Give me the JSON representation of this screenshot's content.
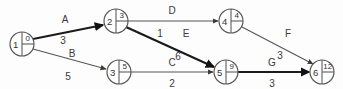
{
  "diagram": {
    "type": "activity-network-pert-cpm",
    "canvas": {
      "width": 343,
      "height": 89,
      "background": "#fdfdfd"
    },
    "colors": {
      "node_stroke": "#555555",
      "node_fill": "#ffffff",
      "edge_thin": "#555555",
      "edge_bold": "#1a1a1a",
      "text": "#333333"
    },
    "nodes": [
      {
        "id": "n1",
        "number": "1",
        "value": "0",
        "cx": 22,
        "cy": 44,
        "r": 12
      },
      {
        "id": "n2",
        "number": "2",
        "value": "3",
        "cx": 116,
        "cy": 21,
        "r": 12
      },
      {
        "id": "n3",
        "number": "3",
        "value": "5",
        "cx": 119,
        "cy": 72,
        "r": 12
      },
      {
        "id": "n4",
        "number": "4",
        "value": "4",
        "cx": 231,
        "cy": 21,
        "r": 12
      },
      {
        "id": "n5",
        "number": "5",
        "value": "9",
        "cx": 226,
        "cy": 72,
        "r": 12
      },
      {
        "id": "n6",
        "number": "6",
        "value": "12",
        "cx": 322,
        "cy": 72,
        "r": 12
      }
    ],
    "edges": [
      {
        "id": "eA",
        "label": "A",
        "weight": "3",
        "from": "1",
        "to": "2",
        "emphasis": "bold",
        "x1": 33,
        "y1": 39,
        "x2": 103,
        "y2": 25,
        "label_x": 65,
        "label_y": 19,
        "weight_x": 63,
        "weight_y": 40
      },
      {
        "id": "eB",
        "label": "B",
        "weight": "5",
        "from": "1",
        "to": "3",
        "emphasis": "thin",
        "x1": 33,
        "y1": 49,
        "x2": 106,
        "y2": 69,
        "label_x": 72,
        "label_y": 53,
        "weight_x": 68,
        "weight_y": 76
      },
      {
        "id": "eD",
        "label": "D",
        "weight": "1",
        "from": "2",
        "to": "4",
        "emphasis": "thin",
        "x1": 128,
        "y1": 21,
        "x2": 218,
        "y2": 21,
        "label_x": 172,
        "label_y": 10,
        "weight_x": 160,
        "weight_y": 33
      },
      {
        "id": "eE",
        "label": "E",
        "weight": "6",
        "from": "2",
        "to": "5",
        "emphasis": "bold",
        "x1": 126,
        "y1": 27,
        "x2": 214,
        "y2": 67,
        "label_x": 186,
        "label_y": 33,
        "weight_x": 178,
        "weight_y": 56
      },
      {
        "id": "eC",
        "label": "C",
        "weight": "2",
        "from": "3",
        "to": "5",
        "emphasis": "thin",
        "x1": 131,
        "y1": 72,
        "x2": 213,
        "y2": 72,
        "label_x": 172,
        "label_y": 62,
        "weight_x": 172,
        "weight_y": 83
      },
      {
        "id": "eF",
        "label": "F",
        "weight": "3",
        "from": "4",
        "to": "6",
        "emphasis": "thin",
        "x1": 242,
        "y1": 27,
        "x2": 313,
        "y2": 64,
        "label_x": 288,
        "label_y": 33,
        "weight_x": 280,
        "weight_y": 55
      },
      {
        "id": "eG",
        "label": "G",
        "weight": "3",
        "from": "5",
        "to": "6",
        "emphasis": "bold",
        "x1": 238,
        "y1": 72,
        "x2": 309,
        "y2": 72,
        "label_x": 272,
        "label_y": 62,
        "weight_x": 272,
        "weight_y": 83
      }
    ]
  }
}
